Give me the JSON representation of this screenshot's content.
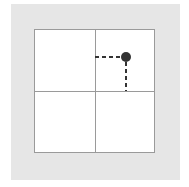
{
  "diagram": {
    "type": "quadrant-grid-point",
    "background_color": "#e6e6e6",
    "grid_color": "#9a9a9a",
    "point_color": "#333333",
    "point": {
      "quadrant": "top-right",
      "x": 126,
      "y": 57,
      "radius": 5
    },
    "projection_lines": {
      "style": "dashed",
      "color": "#333333",
      "horizontal_to_x": 95,
      "vertical_to_y": 91
    },
    "labels": []
  }
}
